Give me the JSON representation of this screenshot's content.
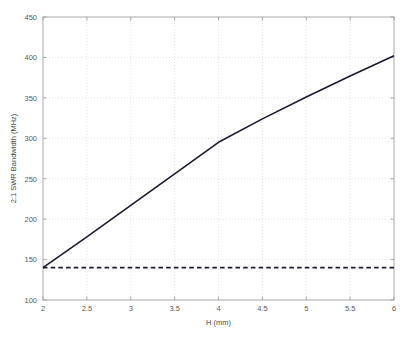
{
  "chart_data": {
    "type": "line",
    "title": "",
    "xlabel": "H (mm)",
    "ylabel": "2:1 SWR Bandwidth (MHz)",
    "xlim": [
      2,
      6
    ],
    "ylim": [
      100,
      450
    ],
    "xticks": [
      2,
      2.5,
      3,
      3.5,
      4,
      4.5,
      5,
      5.5,
      6
    ],
    "xticklabels": [
      "2",
      "2.5",
      "3",
      "3.5",
      "4",
      "4.5",
      "5",
      "5.5",
      "6"
    ],
    "yticks": [
      100,
      150,
      200,
      250,
      300,
      350,
      400,
      450
    ],
    "yticklabels": [
      "100",
      "150",
      "200",
      "250",
      "300",
      "350",
      "400",
      "450"
    ],
    "grid": true,
    "grid_style": "dotted",
    "grid_color": "#d8d8d8",
    "legend": null,
    "legend_position": "none",
    "axis_color": "#a0a0a0",
    "background": "#ffffff",
    "series": [
      {
        "name": "2:1 SWR Bandwidth",
        "style": "solid",
        "color": "#1a1a2e",
        "linewidth": 1.6,
        "x": [
          2,
          2.5,
          3,
          3.5,
          4,
          4.5,
          5,
          5.5,
          6
        ],
        "values": [
          140,
          178,
          217,
          256,
          295,
          324,
          351,
          377,
          402
        ]
      },
      {
        "name": "Reference level",
        "style": "dashed",
        "color": "#1a1a2e",
        "linewidth": 1.6,
        "x": [
          2,
          6
        ],
        "values": [
          140,
          140
        ]
      }
    ]
  },
  "layout": {
    "plot_left": 43,
    "plot_right": 394,
    "plot_top": 17,
    "plot_bottom": 300
  }
}
